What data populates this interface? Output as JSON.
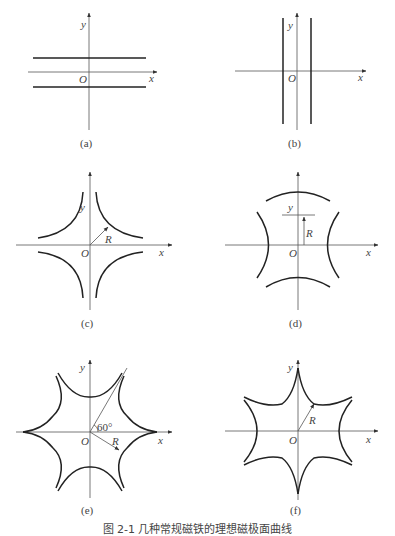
{
  "figure": {
    "caption": "图 2-1  几种常规磁铁的理想磁极面曲线",
    "panels": [
      {
        "id": "a",
        "label": "(a)",
        "x_axis": "x",
        "y_axis": "y",
        "origin": "O",
        "description": "dipole: two horizontal parallel lines"
      },
      {
        "id": "b",
        "label": "(b)",
        "x_axis": "x",
        "y_axis": "y",
        "origin": "O",
        "description": "dipole: two vertical parallel lines"
      },
      {
        "id": "c",
        "label": "(c)",
        "x_axis": "x",
        "y_axis": "y",
        "origin": "O",
        "radius_label": "R",
        "description": "quadrupole: four hyperbolic poles along diagonals"
      },
      {
        "id": "d",
        "label": "(d)",
        "x_axis": "x",
        "y_axis": "y",
        "origin": "O",
        "radius_label": "R",
        "description": "quadrupole: four hyperbolic poles along axes"
      },
      {
        "id": "e",
        "label": "(e)",
        "x_axis": "x",
        "y_axis": "y",
        "origin": "O",
        "radius_label": "R",
        "angle_label": "60°",
        "description": "sextupole: six poles"
      },
      {
        "id": "f",
        "label": "(f)",
        "x_axis": "x",
        "y_axis": "y",
        "origin": "O",
        "radius_label": "R",
        "description": "sextupole: six poles, rotated"
      }
    ]
  }
}
